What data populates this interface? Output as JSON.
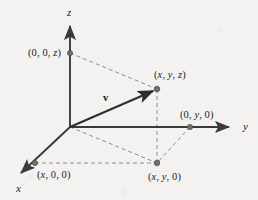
{
  "figure": {
    "type": "3d-coordinate-diagram",
    "background_color": "#f3f2f1",
    "stroke_color": "#3a3a3a",
    "dash_color": "#8c8c8c",
    "point_color": "#6f6f6f",
    "axes": [
      {
        "name": "x",
        "label": "x",
        "label_x": 16,
        "label_y": 183,
        "tip_x": 17,
        "tip_y": 177
      },
      {
        "name": "y",
        "label": "y",
        "label_x": 243,
        "label_y": 121,
        "tip_x": 234,
        "tip_y": 127
      },
      {
        "name": "z",
        "label": "z",
        "label_x": 67,
        "label_y": 7,
        "tip_x": 70,
        "tip_y": 21
      }
    ],
    "origin": {
      "x": 70,
      "y": 127
    },
    "vector": {
      "name": "v",
      "label": "v",
      "label_x": 103,
      "label_y": 93,
      "from_x": 70,
      "from_y": 127,
      "to_x": 157,
      "to_y": 89
    },
    "points": [
      {
        "name": "point-z-axis",
        "label": "(0, 0, z)",
        "dot_x": 70,
        "dot_y": 53,
        "label_x": 28,
        "label_y": 48
      },
      {
        "name": "point-xyz",
        "label": "(x, y, z)",
        "dot_x": 157,
        "dot_y": 89,
        "label_x": 154,
        "label_y": 70
      },
      {
        "name": "point-y-axis",
        "label": "(0, y, 0)",
        "dot_x": 190,
        "dot_y": 127,
        "label_x": 180,
        "label_y": 110
      },
      {
        "name": "point-x-axis",
        "label": "(x, 0, 0)",
        "dot_x": 35,
        "dot_y": 163,
        "label_x": 37,
        "label_y": 170
      },
      {
        "name": "point-xy-plane",
        "label": "(x, y, 0)",
        "dot_x": 157,
        "dot_y": 163,
        "label_x": 148,
        "label_y": 172
      }
    ],
    "dashed_segments": [
      {
        "name": "dash-z-to-xyz",
        "x1": 70,
        "y1": 53,
        "x2": 157,
        "y2": 89
      },
      {
        "name": "dash-xyz-to-xy0",
        "x1": 157,
        "y1": 89,
        "x2": 157,
        "y2": 163
      },
      {
        "name": "dash-x00-to-xy0",
        "x1": 35,
        "y1": 163,
        "x2": 157,
        "y2": 163
      },
      {
        "name": "dash-origin-to-xy0",
        "x1": 70,
        "y1": 127,
        "x2": 157,
        "y2": 163
      },
      {
        "name": "dash-0y0-to-xy0",
        "x1": 190,
        "y1": 127,
        "x2": 157,
        "y2": 163
      }
    ]
  }
}
